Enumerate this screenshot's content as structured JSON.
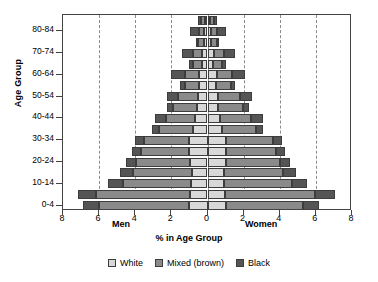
{
  "chart_data": {
    "type": "bar",
    "subtype": "population-pyramid-stacked-horizontal",
    "title": "",
    "xlabel": "% in Age Group",
    "ylabel": "Age Group",
    "side_labels": {
      "left": "Men",
      "right": "Women"
    },
    "xlim": [
      -8,
      8
    ],
    "xticks": [
      8,
      6,
      4,
      2,
      0,
      2,
      4,
      6,
      8
    ],
    "xtick_positions": [
      -8,
      -6,
      -4,
      -2,
      0,
      2,
      4,
      6,
      8
    ],
    "gridlines_at": [
      -6,
      -4,
      -2,
      2,
      4,
      6
    ],
    "grid": true,
    "grid_style": "dashed-vertical",
    "legend_position": "bottom-center",
    "legend": [
      "White",
      "Mixed (brown)",
      "Black"
    ],
    "colors": {
      "white": "#d8d8d8",
      "mixed": "#8a8a8a",
      "black": "#555555",
      "grid": "#8b8b8b",
      "axis": "#444444"
    },
    "categories": [
      "0-4",
      "5-9",
      "10-14",
      "15-19",
      "20-24",
      "25-29",
      "30-34",
      "35-39",
      "40-44",
      "45-49",
      "50-54",
      "55-59",
      "60-64",
      "65-69",
      "70-74",
      "75-79",
      "80-84",
      "85+"
    ],
    "ytick_labels": [
      "0-4",
      "10-14",
      "20-24",
      "30-34",
      "40-44",
      "50-54",
      "60-64",
      "70-74",
      "80-84"
    ],
    "series": [
      {
        "name": "Men White",
        "side": "left",
        "race": "white",
        "values": [
          1.0,
          0.95,
          0.9,
          0.85,
          0.95,
          1.0,
          1.0,
          0.8,
          0.7,
          0.6,
          0.55,
          0.45,
          0.45,
          0.3,
          0.3,
          0.2,
          0.2,
          0.15
        ]
      },
      {
        "name": "Men Mixed (brown)",
        "side": "left",
        "race": "mixed",
        "values": [
          5.0,
          5.2,
          3.8,
          3.3,
          3.0,
          2.7,
          2.5,
          1.9,
          1.6,
          1.3,
          1.1,
          0.8,
          0.8,
          0.5,
          0.5,
          0.3,
          0.25,
          0.2
        ]
      },
      {
        "name": "Men Black",
        "side": "left",
        "race": "black",
        "values": [
          0.9,
          1.0,
          0.8,
          0.7,
          0.55,
          0.5,
          0.5,
          0.4,
          0.6,
          0.35,
          0.6,
          0.25,
          0.75,
          0.2,
          0.6,
          0.15,
          0.5,
          0.2
        ]
      },
      {
        "name": "Women White",
        "side": "right",
        "race": "white",
        "values": [
          1.0,
          0.95,
          0.9,
          0.9,
          1.0,
          1.0,
          1.0,
          0.8,
          0.7,
          0.6,
          0.6,
          0.45,
          0.5,
          0.3,
          0.35,
          0.2,
          0.2,
          0.15
        ]
      },
      {
        "name": "Women Mixed (brown)",
        "side": "right",
        "race": "mixed",
        "values": [
          4.3,
          5.0,
          3.8,
          3.3,
          3.0,
          2.8,
          2.6,
          1.9,
          1.7,
          1.35,
          1.2,
          0.85,
          0.85,
          0.5,
          0.55,
          0.3,
          0.3,
          0.2
        ]
      },
      {
        "name": "Women Black",
        "side": "right",
        "race": "black",
        "values": [
          0.85,
          1.1,
          0.8,
          0.7,
          0.55,
          0.5,
          0.5,
          0.4,
          0.65,
          0.35,
          0.65,
          0.25,
          0.75,
          0.2,
          0.6,
          0.15,
          0.5,
          0.2
        ]
      }
    ]
  }
}
